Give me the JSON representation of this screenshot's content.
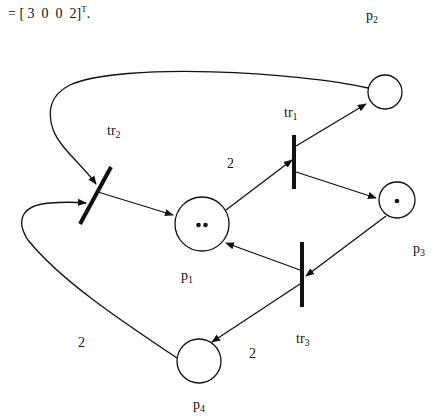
{
  "formula": {
    "prefix": "= [ 3  0  0  2]",
    "superscript": "T",
    "suffix": "."
  },
  "places": [
    {
      "id": "p1",
      "base": "p",
      "sub": "1",
      "tokens": 2
    },
    {
      "id": "p2",
      "base": "p",
      "sub": "2",
      "tokens": 0
    },
    {
      "id": "p3",
      "base": "p",
      "sub": "3",
      "tokens": 1
    },
    {
      "id": "p4",
      "base": "p",
      "sub": "4",
      "tokens": 0
    }
  ],
  "transitions": [
    {
      "id": "tr1",
      "base": "tr",
      "sub": "1"
    },
    {
      "id": "tr2",
      "base": "tr",
      "sub": "2"
    },
    {
      "id": "tr3",
      "base": "tr",
      "sub": "3"
    }
  ],
  "arcs": [
    {
      "from": "p1",
      "to": "tr1",
      "weight": "2"
    },
    {
      "from": "tr1",
      "to": "p2",
      "weight": ""
    },
    {
      "from": "tr1",
      "to": "p3",
      "weight": ""
    },
    {
      "from": "p2",
      "to": "tr2",
      "weight": ""
    },
    {
      "from": "tr2",
      "to": "p1",
      "weight": ""
    },
    {
      "from": "p3",
      "to": "tr3",
      "weight": ""
    },
    {
      "from": "tr3",
      "to": "p1",
      "weight": ""
    },
    {
      "from": "tr3",
      "to": "p4",
      "weight": "2"
    },
    {
      "from": "p4",
      "to": "tr2",
      "weight": "2"
    }
  ],
  "arc_weight_labels": {
    "p1_tr1": "2",
    "tr3_p4": "2",
    "p4_tr2": "2"
  }
}
